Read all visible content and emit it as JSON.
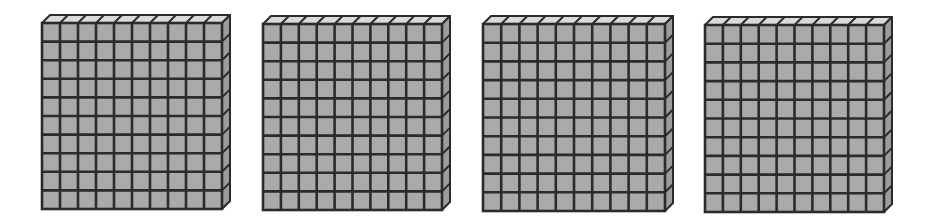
{
  "diagram": {
    "block_count": 4,
    "rows_per_block": 10,
    "cols_per_block": 10,
    "units_per_block": 100,
    "total_value": 400,
    "colors": {
      "front": "#a9a9a9",
      "top": "#dadada",
      "side": "#9c9c9c",
      "line": "#2b2b2b",
      "background": "#ffffff"
    },
    "depth": {
      "dx": 8,
      "dy": -8
    },
    "blocks": [
      {
        "id": "block-1",
        "x": 42,
        "y": 23,
        "width": 180,
        "height": 186
      },
      {
        "id": "block-2",
        "x": 263,
        "y": 24,
        "width": 179,
        "height": 186
      },
      {
        "id": "block-3",
        "x": 483,
        "y": 24,
        "width": 182,
        "height": 187
      },
      {
        "id": "block-4",
        "x": 705,
        "y": 25,
        "width": 179,
        "height": 187
      }
    ]
  }
}
